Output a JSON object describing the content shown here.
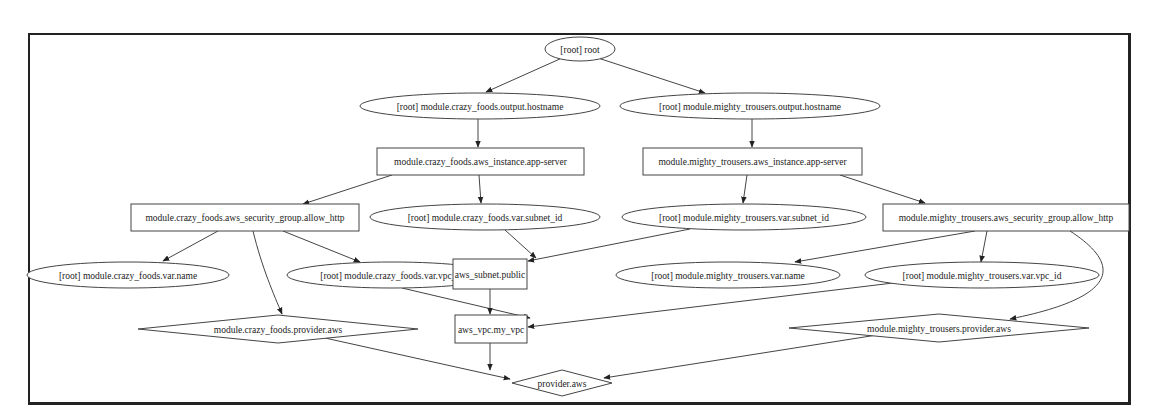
{
  "diagram": {
    "type": "terraform-dependency-graph",
    "nodes": [
      {
        "id": "root",
        "label": "[root] root",
        "shape": "ellipse",
        "cx": 580,
        "cy": 49,
        "rx": 35,
        "ry": 12
      },
      {
        "id": "cf_output",
        "label": "[root] module.crazy_foods.output.hostname",
        "shape": "ellipse",
        "cx": 480,
        "cy": 106,
        "rx": 120,
        "ry": 13
      },
      {
        "id": "mt_output",
        "label": "[root] module.mighty_trousers.output.hostname",
        "shape": "ellipse",
        "cx": 750,
        "cy": 106,
        "rx": 130,
        "ry": 13
      },
      {
        "id": "cf_instance",
        "label": "module.crazy_foods.aws_instance.app-server",
        "shape": "box",
        "x": 377,
        "y": 148,
        "w": 207,
        "h": 27
      },
      {
        "id": "mt_instance",
        "label": "module.mighty_trousers.aws_instance.app-server",
        "shape": "box",
        "x": 643,
        "y": 148,
        "w": 219,
        "h": 27
      },
      {
        "id": "cf_sg",
        "label": "module.crazy_foods.aws_security_group.allow_http",
        "shape": "box",
        "x": 131,
        "y": 204,
        "w": 228,
        "h": 27
      },
      {
        "id": "cf_subnet_id",
        "label": "[root] module.crazy_foods.var.subnet_id",
        "shape": "ellipse",
        "cx": 485,
        "cy": 217,
        "rx": 115,
        "ry": 13
      },
      {
        "id": "mt_subnet_id",
        "label": "[root] module.mighty_trousers.var.subnet_id",
        "shape": "ellipse",
        "cx": 744,
        "cy": 217,
        "rx": 122,
        "ry": 13
      },
      {
        "id": "mt_sg",
        "label": "module.mighty_trousers.aws_security_group.allow_http",
        "shape": "box",
        "x": 883,
        "y": 204,
        "w": 246,
        "h": 27
      },
      {
        "id": "cf_name",
        "label": "[root] module.crazy_foods.var.name",
        "shape": "ellipse",
        "cx": 128,
        "cy": 275,
        "rx": 101,
        "ry": 13
      },
      {
        "id": "cf_vpc_id",
        "label": "[root] module.crazy_foods.var.vpc_id",
        "shape": "ellipse",
        "cx": 392,
        "cy": 275,
        "rx": 105,
        "ry": 13
      },
      {
        "id": "subnet_public",
        "label": "aws_subnet.public",
        "shape": "box",
        "x": 453,
        "y": 259,
        "w": 74,
        "h": 30
      },
      {
        "id": "mt_name",
        "label": "[root] module.mighty_trousers.var.name",
        "shape": "ellipse",
        "cx": 728,
        "cy": 275,
        "rx": 112,
        "ry": 13
      },
      {
        "id": "mt_vpc_id",
        "label": "[root] module.mighty_trousers.var.vpc_id",
        "shape": "ellipse",
        "cx": 982,
        "cy": 275,
        "rx": 117,
        "ry": 13
      },
      {
        "id": "cf_provider",
        "label": "module.crazy_foods.provider.aws",
        "shape": "diamond",
        "cx": 278,
        "cy": 329,
        "hw": 140,
        "hh": 14
      },
      {
        "id": "vpc",
        "label": "aws_vpc.my_vpc",
        "shape": "box",
        "x": 455,
        "y": 315,
        "w": 72,
        "h": 28
      },
      {
        "id": "mt_provider",
        "label": "module.mighty_trousers.provider.aws",
        "shape": "diamond",
        "cx": 939,
        "cy": 328,
        "hw": 150,
        "hh": 14
      },
      {
        "id": "provider_aws",
        "label": "provider.aws",
        "shape": "diamond",
        "cx": 562,
        "cy": 383,
        "hw": 50,
        "hh": 13
      }
    ],
    "edges": [
      {
        "from": "root",
        "to": "cf_output",
        "path": "M562,58 L486,92"
      },
      {
        "from": "root",
        "to": "mt_output",
        "path": "M598,58 L705,93"
      },
      {
        "from": "cf_output",
        "to": "cf_instance",
        "path": "M478,119 L478,147"
      },
      {
        "from": "mt_output",
        "to": "mt_instance",
        "path": "M752,119 L752,147"
      },
      {
        "from": "cf_instance",
        "to": "cf_sg",
        "path": "M392,175 L303,204"
      },
      {
        "from": "cf_instance",
        "to": "cf_subnet_id",
        "path": "M479,175 L481,203"
      },
      {
        "from": "mt_instance",
        "to": "mt_subnet_id",
        "path": "M747,175 L743,203"
      },
      {
        "from": "mt_instance",
        "to": "mt_sg",
        "path": "M840,175 L925,203"
      },
      {
        "from": "cf_sg",
        "to": "cf_name",
        "path": "M218,231 L163,261"
      },
      {
        "from": "cf_sg",
        "to": "cf_vpc_id",
        "path": "M283,231 L360,262"
      },
      {
        "from": "cf_sg",
        "to": "cf_provider",
        "path": "M253,231 C262,268 274,295 282,314"
      },
      {
        "from": "cf_subnet_id",
        "to": "subnet_public",
        "path": "M505,230 L536,258"
      },
      {
        "from": "mt_subnet_id",
        "to": "subnet_public",
        "path": "M690,229 L528,261"
      },
      {
        "from": "mt_sg",
        "to": "mt_name",
        "path": "M975,231 L795,262"
      },
      {
        "from": "mt_sg",
        "to": "mt_vpc_id",
        "path": "M987,231 L981,262"
      },
      {
        "from": "mt_sg",
        "to": "mt_provider",
        "path": "M1070,231 C1115,260 1130,295 1010,319"
      },
      {
        "from": "cf_vpc_id",
        "to": "vpc",
        "path": "M402,288 L530,318"
      },
      {
        "from": "subnet_public",
        "to": "vpc",
        "path": "M490,289 L490,314"
      },
      {
        "from": "mt_vpc_id",
        "to": "vpc",
        "path": "M893,283 L528,327"
      },
      {
        "from": "cf_provider",
        "to": "provider_aws",
        "path": "M325,338 L510,379"
      },
      {
        "from": "vpc",
        "to": "provider_aws",
        "path": "M490,343 L490,370"
      },
      {
        "from": "mt_provider",
        "to": "provider_aws",
        "path": "M877,335 L604,378"
      }
    ]
  },
  "colors": {
    "stroke": "#444444",
    "text": "#222222",
    "background": "#ffffff",
    "frame": "#222222"
  }
}
